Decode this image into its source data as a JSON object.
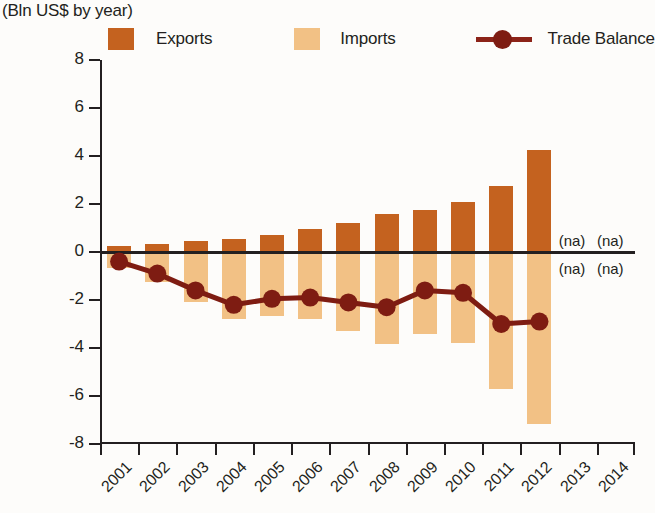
{
  "subtitle": "(Bln US$ by year)",
  "legend": {
    "exports_label": "Exports",
    "imports_label": "Imports",
    "balance_label": "Trade Balance"
  },
  "colors": {
    "exports": "#c4621f",
    "imports": "#f2c185",
    "trade_balance": "#7e1c12",
    "axis": "#231f20",
    "background": "#fdfcfa"
  },
  "annotations": {
    "na": "(na)",
    "na_points": [
      {
        "year": "2013",
        "position": "above-axis"
      },
      {
        "year": "2014",
        "position": "above-axis"
      },
      {
        "year": "2013",
        "position": "below-axis"
      },
      {
        "year": "2014",
        "position": "below-axis"
      }
    ]
  },
  "chart_data": {
    "type": "bar",
    "title": "",
    "subtitle": "(Bln US$ by year)",
    "xlabel": "",
    "ylabel": "",
    "ylim": [
      -8,
      8
    ],
    "yticks": [
      8,
      6,
      4,
      2,
      0,
      -2,
      -4,
      -6,
      -8
    ],
    "ytick_labels": [
      "8",
      "6",
      "4",
      "2",
      "0",
      "-2",
      "-4",
      "-6",
      "-8"
    ],
    "grid": false,
    "legend_position": "top",
    "categories": [
      "2001",
      "2002",
      "2003",
      "2004",
      "2005",
      "2006",
      "2007",
      "2008",
      "2009",
      "2010",
      "2011",
      "2012",
      "2013",
      "2014"
    ],
    "series": [
      {
        "name": "Exports",
        "type": "bar",
        "color": "#c4621f",
        "values": [
          0.25,
          0.35,
          0.45,
          0.55,
          0.7,
          0.95,
          1.2,
          1.6,
          1.75,
          2.1,
          2.75,
          4.25,
          null,
          null
        ]
      },
      {
        "name": "Imports",
        "type": "bar",
        "color": "#f2c185",
        "values": [
          -0.65,
          -1.25,
          -2.1,
          -2.8,
          -2.65,
          -2.8,
          -3.3,
          -3.85,
          -3.4,
          -3.8,
          -5.7,
          -7.15,
          null,
          null
        ]
      },
      {
        "name": "Trade Balance",
        "type": "line",
        "color": "#7e1c12",
        "values": [
          -0.4,
          -0.9,
          -1.6,
          -2.2,
          -1.95,
          -1.9,
          -2.1,
          -2.3,
          -1.6,
          -1.7,
          -3.0,
          -2.9,
          null,
          null
        ]
      }
    ],
    "missing_data_label": "(na)",
    "missing_data_years": [
      "2013",
      "2014"
    ]
  }
}
